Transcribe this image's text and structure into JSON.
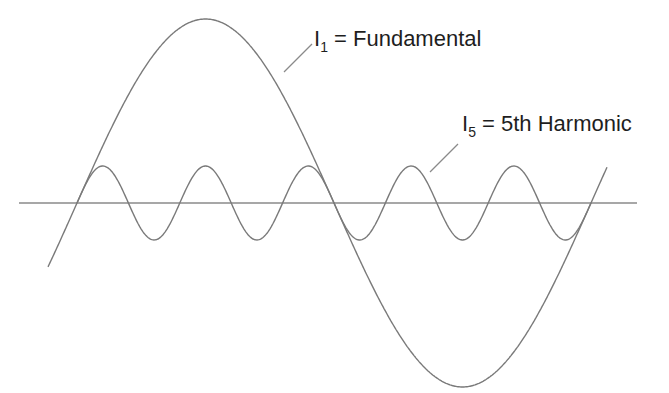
{
  "diagram": {
    "labels": {
      "fundamental": {
        "symbol": "I",
        "subscript": "1",
        "text": " = Fundamental"
      },
      "harmonic": {
        "symbol": "I",
        "subscript": "5",
        "text": " = 5th Harmonic"
      }
    },
    "colors": {
      "axis": "#8a8a8a",
      "curve": "#7a7a7a",
      "leader": "#8a8a8a",
      "text": "#1e1e1e",
      "background": "#ffffff"
    },
    "axis": {
      "x1": 19,
      "x2": 637,
      "y": 203
    },
    "fundamental": {
      "x_start": 48,
      "x_end": 607,
      "zero_x": 77,
      "period": 514,
      "amplitude": 184
    },
    "harmonic": {
      "x_start": 77,
      "x_end": 591,
      "zero_x": 77,
      "period": 102.8,
      "amplitude": 37
    },
    "leaders": [
      {
        "name": "fundamental-leader",
        "x1": 284,
        "y1": 72,
        "x2": 312,
        "y2": 44
      },
      {
        "name": "harmonic-leader",
        "x1": 430,
        "y1": 172,
        "x2": 458,
        "y2": 144
      }
    ]
  }
}
